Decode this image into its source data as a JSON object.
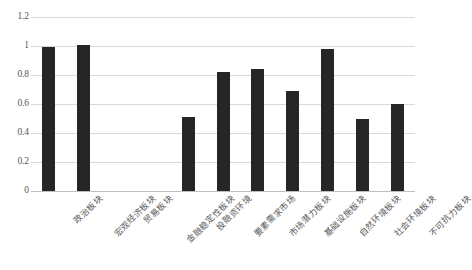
{
  "chart_data": {
    "type": "bar",
    "title": "",
    "subtitle": "",
    "xlabel": "",
    "ylabel": "",
    "ylim": [
      0,
      1.2
    ],
    "yticks": [
      "0",
      "0.2",
      "0.4",
      "0.6",
      "0.8",
      "1",
      "1.2"
    ],
    "ytick_values": [
      0,
      0.2,
      0.4,
      0.6,
      0.8,
      1.0,
      1.2
    ],
    "grid": true,
    "legend": false,
    "bar_color": "#262626",
    "gridline_color": "#d9d9d9",
    "categories": [
      "政治板块",
      "宏观经济板块",
      "贸易板块",
      "金融稳定性板块",
      "投融资环境",
      "要素需求市场",
      "市场潜力板块",
      "基础设施板块",
      "自然环境板块",
      "社会环境板块",
      "不可抗力板块"
    ],
    "values": [
      0.99,
      1.01,
      0,
      0,
      0.51,
      0.82,
      0.84,
      0.69,
      0.98,
      0.5,
      0.6
    ]
  }
}
